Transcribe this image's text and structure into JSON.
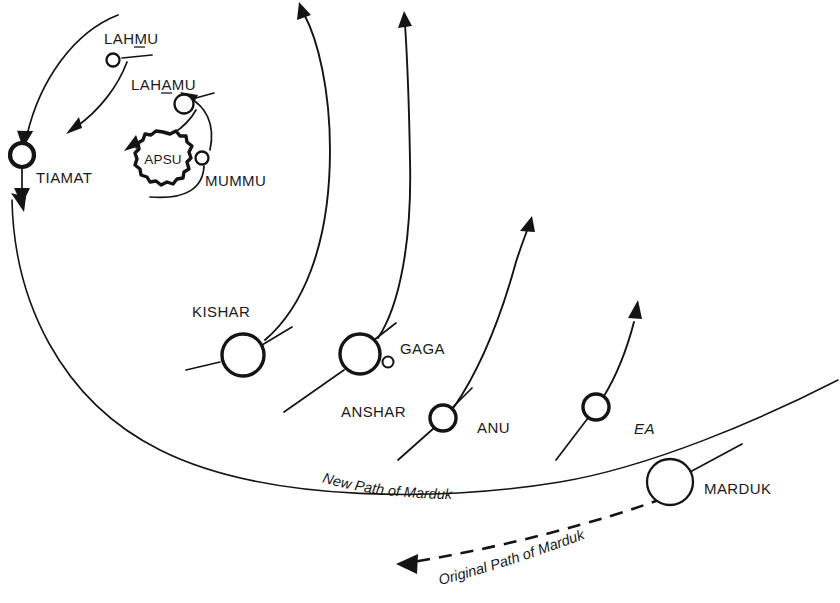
{
  "figure": {
    "background_color": "#ffffff",
    "ink_color": "#141414",
    "width": 840,
    "height": 603
  },
  "bodies": [
    {
      "id": "tiamat",
      "label": "TIAMAT",
      "cx": 22,
      "cy": 155,
      "r": 12,
      "ring": "thick"
    },
    {
      "id": "lahmu",
      "label": "LAHMU",
      "cx": 113,
      "cy": 60,
      "r": 6.5,
      "ring": "thin",
      "underline_char_index": 3
    },
    {
      "id": "lahamu",
      "label": "LAHAMU",
      "cx": 184,
      "cy": 104,
      "r": 9.5,
      "ring": "thin",
      "underline_char_index": 3
    },
    {
      "id": "mummu",
      "label": "MUMMU",
      "cx": 202,
      "cy": 158,
      "r": 6.5,
      "ring": "thin"
    },
    {
      "id": "apsu",
      "label": "APSU",
      "cx": 163,
      "cy": 159,
      "r": 27,
      "ring": "blob"
    },
    {
      "id": "kishar",
      "label": "KISHAR",
      "cx": 243,
      "cy": 355,
      "r": 21,
      "ring": "med"
    },
    {
      "id": "anshar",
      "label": "ANSHAR",
      "cx": 360,
      "cy": 354,
      "r": 20,
      "ring": "med"
    },
    {
      "id": "gaga",
      "label": "GAGA",
      "cx": 388,
      "cy": 362,
      "r": 5.5,
      "ring": "tiny"
    },
    {
      "id": "anu",
      "label": "ANU",
      "cx": 443,
      "cy": 418,
      "r": 13,
      "ring": "med"
    },
    {
      "id": "ea",
      "label": "EA",
      "cx": 596,
      "cy": 407,
      "r": 13,
      "ring": "med"
    },
    {
      "id": "marduk",
      "label": "MARDUK",
      "cx": 670,
      "cy": 482,
      "r": 23,
      "ring": "thin"
    }
  ],
  "labels": {
    "tiamat": {
      "text": "TIAMAT",
      "x": 36,
      "y": 183
    },
    "lahmu": {
      "text": "LAHMU",
      "x": 104,
      "y": 44
    },
    "lahamu": {
      "text": "LAHAMU",
      "x": 131,
      "y": 90
    },
    "mummu": {
      "text": "MUMMU",
      "x": 205,
      "y": 186
    },
    "apsu": {
      "text": "APSU",
      "x": 163,
      "y": 164
    },
    "kishar": {
      "text": "KISHAR",
      "x": 192,
      "y": 317
    },
    "anshar": {
      "text": "ANSHAR",
      "x": 341,
      "y": 417
    },
    "gaga": {
      "text": "GAGA",
      "x": 400,
      "y": 354
    },
    "anu": {
      "text": "ANU",
      "x": 477,
      "y": 433
    },
    "ea": {
      "text": "EA",
      "x": 634,
      "y": 434
    },
    "marduk": {
      "text": "MARDUK",
      "x": 704,
      "y": 494
    }
  },
  "paths": {
    "new_path": {
      "label": "New Path of Marduk",
      "style": "solid",
      "label_start_x": 322,
      "label_start_y": 484
    },
    "original_path": {
      "label": "Original Path of Marduk",
      "style": "dashed",
      "label_start_x": 459,
      "label_start_y": 579,
      "arrow_direction": "left",
      "arrow_tip_x": 400,
      "arrow_tip_y": 563
    }
  },
  "arrows": {
    "orbital_motion_direction": "counter-clockwise",
    "count_outward_trajectories": 4,
    "count_orbital_arcs": 4
  },
  "icon_names": [
    "planet-circle-icon",
    "apsu-sun-icon",
    "arrowhead-icon",
    "dashed-path-icon",
    "orbit-arc-icon"
  ]
}
